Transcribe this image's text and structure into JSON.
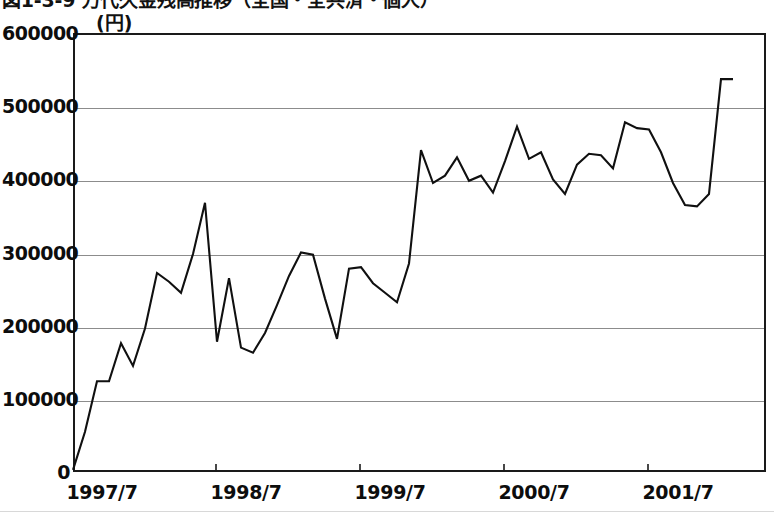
{
  "title": {
    "text": "図1-3-9 万代久金残高推移（全国・全共済・個人）",
    "cropped": true
  },
  "unit_label": "(円)",
  "axes": {
    "y_ticks": [
      "600000",
      "500000",
      "400000",
      "300000",
      "200000",
      "100000",
      "0"
    ],
    "x_ticks": [
      "1997/7",
      "1998/7",
      "1999/7",
      "2000/7",
      "2001/7"
    ]
  },
  "chart_data": {
    "type": "line",
    "title": "図1-3-9 万代久金残高推移（全国・全共済・個人）",
    "xlabel": "",
    "ylabel": "(円)",
    "ylim": [
      0,
      600000
    ],
    "ytick_values": [
      0,
      100000,
      200000,
      300000,
      400000,
      500000,
      600000
    ],
    "grid": true,
    "legend": "none",
    "x_tick_labels": [
      "1997/7",
      "1998/7",
      "1999/7",
      "2000/7",
      "2001/7"
    ],
    "x_tick_index": [
      0,
      12,
      24,
      36,
      48
    ],
    "x_start": "1997/7",
    "x_step": "1 month",
    "x": [
      "1997/7",
      "1997/8",
      "1997/9",
      "1997/10",
      "1997/11",
      "1997/12",
      "1998/1",
      "1998/2",
      "1998/3",
      "1998/4",
      "1998/5",
      "1998/6",
      "1998/7",
      "1998/8",
      "1998/9",
      "1998/10",
      "1998/11",
      "1998/12",
      "1999/1",
      "1999/2",
      "1999/3",
      "1999/4",
      "1999/5",
      "1999/6",
      "1999/7",
      "1999/8",
      "1999/9",
      "1999/10",
      "1999/11",
      "1999/12",
      "2000/1",
      "2000/2",
      "2000/3",
      "2000/4",
      "2000/5",
      "2000/6",
      "2000/7",
      "2000/8",
      "2000/9",
      "2000/10",
      "2000/11",
      "2000/12",
      "2001/1",
      "2001/2",
      "2001/3",
      "2001/4",
      "2001/5",
      "2001/6",
      "2001/7",
      "2001/8",
      "2001/9",
      "2001/10",
      "2001/11",
      "2001/12",
      "2002/1",
      "2002/2"
    ],
    "values": [
      3000,
      55000,
      124000,
      124000,
      176000,
      145000,
      196000,
      272000,
      260000,
      245000,
      298000,
      368000,
      178000,
      265000,
      170000,
      163000,
      190000,
      228000,
      268000,
      300000,
      297000,
      237000,
      182000,
      278000,
      280000,
      258000,
      245000,
      232000,
      285000,
      440000,
      395000,
      405000,
      430000,
      398000,
      405000,
      382000,
      425000,
      472000,
      428000,
      437000,
      400000,
      380000,
      420000,
      435000,
      433000,
      415000,
      478000,
      470000,
      468000,
      437000,
      395000,
      365000,
      363000,
      380000,
      537000,
      537000
    ],
    "series": [
      {
        "name": "残高",
        "color": "#101010",
        "values": [
          3000,
          55000,
          124000,
          124000,
          176000,
          145000,
          196000,
          272000,
          260000,
          245000,
          298000,
          368000,
          178000,
          265000,
          170000,
          163000,
          190000,
          228000,
          268000,
          300000,
          297000,
          237000,
          182000,
          278000,
          280000,
          258000,
          245000,
          232000,
          285000,
          440000,
          395000,
          405000,
          430000,
          398000,
          405000,
          382000,
          425000,
          472000,
          428000,
          437000,
          400000,
          380000,
          420000,
          435000,
          433000,
          415000,
          478000,
          470000,
          468000,
          437000,
          395000,
          365000,
          363000,
          380000,
          537000,
          537000
        ]
      }
    ]
  },
  "colors": {
    "line": "#101010",
    "frame": "#1a1a1a",
    "grid": "#8c8c8c",
    "background": "#ffffff",
    "text": "#0d0d0d"
  }
}
